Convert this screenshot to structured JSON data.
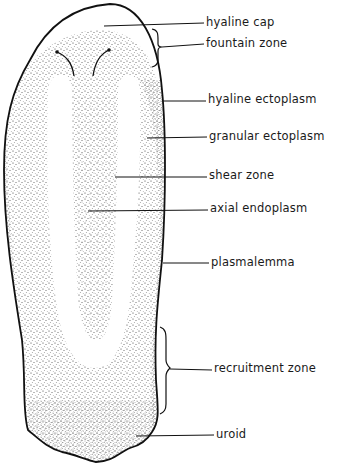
{
  "figure": {
    "labels": [
      {
        "id": "hyaline-cap",
        "text": "hyaline cap",
        "x": 206,
        "y": 12
      },
      {
        "id": "fountain-zone",
        "text": "fountain zone",
        "x": 206,
        "y": 35
      },
      {
        "id": "hyaline-ectoplasm",
        "text": "hyaline ectoplasm",
        "x": 208,
        "y": 91
      },
      {
        "id": "granular-ectoplasm",
        "text": "granular ectoplasm",
        "x": 209,
        "y": 128
      },
      {
        "id": "shear-zone",
        "text": "shear zone",
        "x": 209,
        "y": 166
      },
      {
        "id": "axial-endoplasm",
        "text": "axial endoplasm",
        "x": 210,
        "y": 200
      },
      {
        "id": "plasmalemma",
        "text": "plasmalemma",
        "x": 211,
        "y": 254
      },
      {
        "id": "recruitment-zone",
        "text": "recruitment zone",
        "x": 214,
        "y": 361
      },
      {
        "id": "uroid",
        "text": "uroid",
        "x": 216,
        "y": 425
      }
    ],
    "colors": {
      "outline": "#111111",
      "stipple": "#333333",
      "background": "#ffffff"
    }
  }
}
